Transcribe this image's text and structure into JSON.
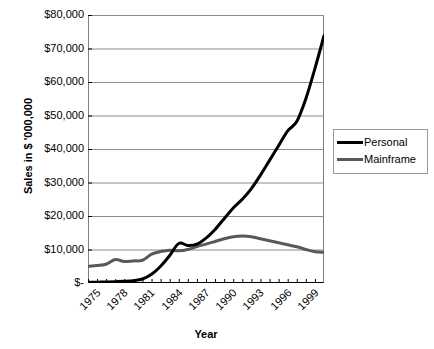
{
  "chart_data": {
    "type": "line",
    "title": "",
    "xlabel": "Year",
    "ylabel": "Sales in $ '000,000",
    "xlim": [
      1975,
      2001
    ],
    "ylim": [
      0,
      80000
    ],
    "grid": true,
    "legend_position": "right",
    "y_ticks": [
      0,
      10000,
      20000,
      30000,
      40000,
      50000,
      60000,
      70000,
      80000
    ],
    "y_tick_labels": [
      "$-",
      "$10,000",
      "$20,000",
      "$30,000",
      "$40,000",
      "$50,000",
      "$60,000",
      "$70,000",
      "$80,000"
    ],
    "x_tick_labels": [
      "1975",
      "1978",
      "1981",
      "1984",
      "1987",
      "1990",
      "1993",
      "1996",
      "1999"
    ],
    "x_tick_values": [
      1975,
      1978,
      1981,
      1984,
      1987,
      1990,
      1993,
      1996,
      1999
    ],
    "x_minor_tick_step": 1,
    "x": [
      1975,
      1976,
      1977,
      1978,
      1979,
      1980,
      1981,
      1982,
      1983,
      1984,
      1985,
      1986,
      1987,
      1988,
      1989,
      1990,
      1991,
      1992,
      1993,
      1994,
      1995,
      1996,
      1997,
      1998,
      1999,
      2000,
      2001
    ],
    "series": [
      {
        "name": "Personal",
        "color": "#000000",
        "line_width": 3,
        "values": [
          200,
          250,
          300,
          400,
          500,
          700,
          1200,
          2600,
          5000,
          8200,
          11800,
          11200,
          11600,
          13400,
          16000,
          19200,
          22400,
          25000,
          28200,
          32200,
          36600,
          41000,
          45400,
          48200,
          55000,
          64000,
          73800
        ]
      },
      {
        "name": "Mainframe",
        "color": "#595959",
        "line_width": 3,
        "values": [
          5000,
          5200,
          5600,
          7000,
          6400,
          6600,
          6800,
          8600,
          9400,
          9800,
          9600,
          10000,
          10900,
          11600,
          12400,
          13200,
          13800,
          14000,
          13800,
          13200,
          12600,
          12000,
          11400,
          10800,
          10000,
          9300,
          9200
        ]
      }
    ]
  },
  "legend": {
    "items": [
      {
        "label": "Personal",
        "color": "#000000"
      },
      {
        "label": "Mainframe",
        "color": "#595959"
      }
    ]
  }
}
